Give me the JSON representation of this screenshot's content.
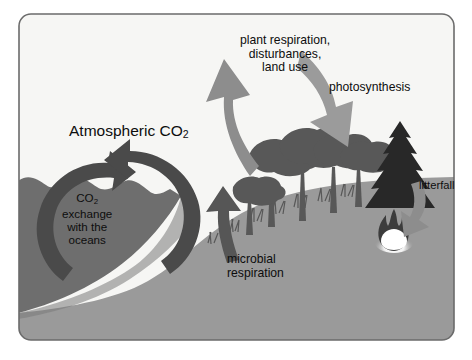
{
  "figure": {
    "frame": {
      "border_color": "#6e6e6e",
      "background": "#f7f7f5",
      "corner_radius": 12
    },
    "palette": {
      "sky": "#f5f5f3",
      "ocean": "#6e6e6e",
      "land": "#9a9a9a",
      "arrow_light": "#8c8c8c",
      "arrow_dark": "#5a5a5a",
      "vegetation": "#595959",
      "conifer": "#2b2b2b",
      "flame_core": "#ffffff",
      "text": "#0d0d0d"
    },
    "labels": {
      "atmospheric_co2": {
        "prefix": "Atmospheric CO",
        "sub": "2"
      },
      "plant_respiration": [
        "plant respiration,",
        "disturbances,",
        "land use"
      ],
      "photosynthesis": "photosynthesis",
      "ocean_exchange": {
        "line1_prefix": "CO",
        "line1_sub": "2",
        "lines": [
          "exchange",
          "with the",
          "oceans"
        ]
      },
      "microbial_respiration": [
        "microbial",
        "respiration"
      ],
      "litterfall": "litterfall"
    },
    "flows": [
      {
        "name": "plant-respiration-arrow",
        "label": "plant respiration, disturbances, land use",
        "direction": "up-left",
        "from": "land biosphere",
        "to": "atmosphere",
        "tone": "light"
      },
      {
        "name": "photosynthesis-arrow",
        "label": "photosynthesis",
        "direction": "down-right",
        "from": "atmosphere",
        "to": "vegetation",
        "tone": "light"
      },
      {
        "name": "ocean-exchange-arrows",
        "label": "CO2 exchange with the oceans",
        "direction": "two-way circular",
        "from": "atmosphere",
        "to": "ocean",
        "tone": "dark"
      },
      {
        "name": "microbial-respiration-arrow",
        "label": "microbial respiration",
        "direction": "up",
        "from": "soil",
        "to": "atmosphere",
        "tone": "dark"
      },
      {
        "name": "litterfall-arrow",
        "label": "litterfall",
        "direction": "down-left",
        "from": "canopy",
        "to": "soil",
        "tone": "light"
      }
    ],
    "scene_elements": [
      {
        "name": "ocean",
        "description": "dark gray water body at left with wave crests"
      },
      {
        "name": "land",
        "description": "medium gray landmass rising from left to right"
      },
      {
        "name": "deciduous-trees",
        "description": "cluster of broadleaf tree silhouettes"
      },
      {
        "name": "conifer-tree",
        "description": "dark evergreen pine at right"
      },
      {
        "name": "grass",
        "description": "tufts of grass along the soil surface"
      },
      {
        "name": "fire",
        "description": "burning flame with bright core on the land"
      }
    ]
  }
}
